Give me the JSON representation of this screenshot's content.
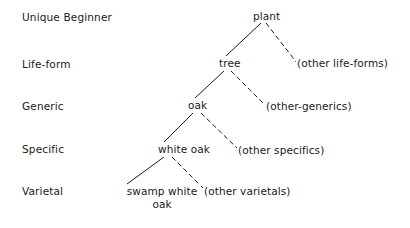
{
  "figure": {
    "background_color": "#ffffff",
    "line_color": "#1a1a1a",
    "text_color": "#1a1a1a"
  },
  "rank_labels": [
    {
      "id": "unique-beginner",
      "text": "Unique Beginner",
      "x": 22,
      "y": 11
    },
    {
      "id": "life-form",
      "text": "Life-form",
      "x": 22,
      "y": 58
    },
    {
      "id": "generic",
      "text": "Generic",
      "x": 22,
      "y": 100
    },
    {
      "id": "specific",
      "text": "Specific",
      "x": 22,
      "y": 143
    },
    {
      "id": "varietal",
      "text": "Varietal",
      "x": 22,
      "y": 185
    }
  ],
  "nodes": [
    {
      "id": "plant",
      "text": "plant",
      "x": 252,
      "y": 10,
      "rank": "unique-beginner",
      "two_line": false
    },
    {
      "id": "tree",
      "text": "tree",
      "x": 218,
      "y": 57,
      "rank": "life-form",
      "two_line": false
    },
    {
      "id": "other-life-forms",
      "text": "(other life-forms)",
      "x": 296,
      "y": 57,
      "rank": "life-form",
      "two_line": false
    },
    {
      "id": "oak",
      "text": "oak",
      "x": 187,
      "y": 99,
      "rank": "generic",
      "two_line": false
    },
    {
      "id": "other-generics",
      "text": "(other-generics)",
      "x": 265,
      "y": 100,
      "rank": "generic",
      "two_line": false
    },
    {
      "id": "white-oak",
      "text": "white oak",
      "x": 157,
      "y": 143,
      "rank": "specific",
      "two_line": false
    },
    {
      "id": "other-specifics",
      "text": "(other specifics)",
      "x": 237,
      "y": 144,
      "rank": "specific",
      "two_line": false
    },
    {
      "id": "swamp-white-oak",
      "text": "swamp white oak",
      "x": 123,
      "y": 185,
      "rank": "varietal",
      "two_line": true,
      "width": 76
    },
    {
      "id": "other-varietals",
      "text": "(other varietals)",
      "x": 203,
      "y": 185,
      "rank": "varietal",
      "two_line": false
    }
  ],
  "edges": [
    {
      "id": "plant-to-tree",
      "from": "plant",
      "to": "tree",
      "style": "solid",
      "x1": 261,
      "y1": 23,
      "x2": 226,
      "y2": 56
    },
    {
      "id": "plant-to-other-life-forms",
      "from": "plant",
      "to": "other-life-forms",
      "style": "dashed",
      "x1": 266,
      "y1": 23,
      "x2": 297,
      "y2": 63
    },
    {
      "id": "tree-to-oak",
      "from": "tree",
      "to": "oak",
      "style": "solid",
      "x1": 224,
      "y1": 71,
      "x2": 195,
      "y2": 98
    },
    {
      "id": "tree-to-other-generics",
      "from": "tree",
      "to": "other-generics",
      "style": "dashed",
      "x1": 231,
      "y1": 71,
      "x2": 267,
      "y2": 107
    },
    {
      "id": "oak-to-white-oak",
      "from": "oak",
      "to": "white-oak",
      "style": "solid",
      "x1": 193,
      "y1": 113,
      "x2": 164,
      "y2": 142
    },
    {
      "id": "oak-to-other-specifics",
      "from": "oak",
      "to": "other-specifics",
      "style": "dashed",
      "x1": 201,
      "y1": 113,
      "x2": 239,
      "y2": 150
    },
    {
      "id": "white-oak-to-swamp-white-oak",
      "from": "white-oak",
      "to": "swamp-white-oak",
      "style": "solid",
      "x1": 164,
      "y1": 157,
      "x2": 127,
      "y2": 184
    },
    {
      "id": "white-oak-to-other-varietals",
      "from": "white-oak",
      "to": "other-varietals",
      "style": "dashed",
      "x1": 172,
      "y1": 157,
      "x2": 204,
      "y2": 189
    }
  ]
}
